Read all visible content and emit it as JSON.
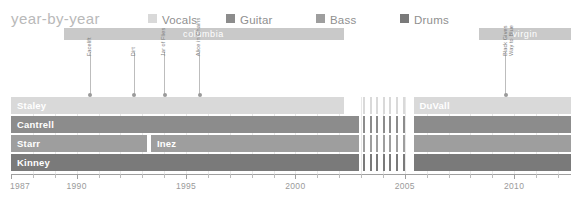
{
  "title": "year-by-year",
  "legend": {
    "items": [
      {
        "label": "Vocals",
        "color": "#d9d9d9"
      },
      {
        "label": "Guitar",
        "color": "#8c8c8c"
      },
      {
        "label": "Bass",
        "color": "#9e9e9e"
      },
      {
        "label": "Drums",
        "color": "#7a7a7a"
      }
    ]
  },
  "labels_bars": [
    {
      "name": "columbia",
      "start_year": 1989.4,
      "end_year": 2002.2
    },
    {
      "name": "virgin",
      "start_year": 2008.4,
      "end_year": 2012.6
    }
  ],
  "albums": [
    {
      "name": "Facelift",
      "year": 1990.6,
      "lines": [
        "Facelift"
      ]
    },
    {
      "name": "Dirt",
      "year": 1992.6,
      "lines": [
        "Dirt"
      ]
    },
    {
      "name": "Jar of Flies",
      "year": 1994.0,
      "lines": [
        "Jar of Flies"
      ]
    },
    {
      "name": "Alice in Chains",
      "year": 1995.6,
      "lines": [
        "Alice in Chains"
      ]
    },
    {
      "name": "Black Gives Way to Blue",
      "year": 2009.6,
      "lines": [
        "Black Gives",
        "Way to Blue"
      ]
    }
  ],
  "rows": [
    {
      "role": "Vocals",
      "color": "#d9d9d9",
      "segments": [
        {
          "member": "Staley",
          "start_year": 1987.0,
          "end_year": 2002.2
        },
        {
          "member": "DuVall",
          "start_year": 2005.4,
          "end_year": 2012.6
        }
      ]
    },
    {
      "role": "Guitar",
      "color": "#8c8c8c",
      "segments": [
        {
          "member": "Cantrell",
          "start_year": 1987.0,
          "end_year": 2002.9
        },
        {
          "member": "",
          "start_year": 2005.4,
          "end_year": 2012.6
        }
      ]
    },
    {
      "role": "Bass",
      "color": "#9e9e9e",
      "segments": [
        {
          "member": "Starr",
          "start_year": 1987.0,
          "end_year": 1993.2
        },
        {
          "member": "Inez",
          "start_year": 1993.4,
          "end_year": 2002.9
        },
        {
          "member": "",
          "start_year": 2005.4,
          "end_year": 2012.6
        }
      ]
    },
    {
      "role": "Drums",
      "color": "#7a7a7a",
      "segments": [
        {
          "member": "Kinney",
          "start_year": 1987.0,
          "end_year": 2002.9
        },
        {
          "member": "",
          "start_year": 2005.4,
          "end_year": 2012.6
        }
      ]
    }
  ],
  "hiatus": {
    "start_year": 2003.1,
    "end_year": 2005.2,
    "stripe_count": 7
  },
  "axis": {
    "min_year": 1987.0,
    "max_year": 2012.6,
    "major_ticks": [
      {
        "year": 1987,
        "label": "1987"
      },
      {
        "year": 1990,
        "label": "1990"
      },
      {
        "year": 1995,
        "label": "1995"
      },
      {
        "year": 2000,
        "label": "2000"
      },
      {
        "year": 2005,
        "label": "2005"
      },
      {
        "year": 2010,
        "label": "2010"
      }
    ],
    "minor_ticks": [
      1988,
      1989,
      1991,
      1992,
      1993,
      1994,
      1996,
      1997,
      1998,
      1999,
      2001,
      2002,
      2003,
      2004,
      2006,
      2007,
      2008,
      2009,
      2011,
      2012
    ]
  },
  "colors": {
    "label_bar": "#c9c9c9",
    "axis_line": "#9f9f9f",
    "tick": "#bcbcbc",
    "grid": "#e8e8e8",
    "title_text": "#b9b9b9",
    "legend_text": "#8f8f8f",
    "tick_text": "#9a9a9a",
    "album_text": "#7d7d7d",
    "marker_line": "#bdbdbd"
  }
}
